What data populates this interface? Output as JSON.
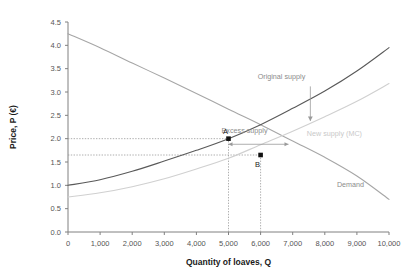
{
  "chart_data": {
    "type": "line",
    "title": "",
    "xlabel": "Quantity of loaves, Q",
    "ylabel": "Price, P (€)",
    "xlim": [
      0,
      10000
    ],
    "ylim": [
      0.0,
      4.5
    ],
    "grid": false,
    "legend": "inline-annotations",
    "xticks": [
      "0",
      "1,000",
      "2,000",
      "3,000",
      "4,000",
      "5,000",
      "6,000",
      "7,000",
      "8,000",
      "9,000",
      "10,000"
    ],
    "xtick_values": [
      0,
      1000,
      2000,
      3000,
      4000,
      5000,
      6000,
      7000,
      8000,
      9000,
      10000
    ],
    "yticks": [
      "0.0",
      "0.5",
      "1.0",
      "1.5",
      "2.0",
      "2.5",
      "3.0",
      "3.5",
      "4.0",
      "4.5"
    ],
    "ytick_values": [
      0.0,
      0.5,
      1.0,
      1.5,
      2.0,
      2.5,
      3.0,
      3.5,
      4.0,
      4.5
    ],
    "series": [
      {
        "name": "Demand",
        "color": "#a6a6a6",
        "label": "Demand",
        "label_point": {
          "x": 8800,
          "y": 0.97
        },
        "x": [
          0,
          1000,
          2000,
          3000,
          4000,
          5000,
          6000,
          7000,
          8000,
          9000,
          10000
        ],
        "values": [
          4.25,
          3.95,
          3.62,
          3.3,
          2.97,
          2.63,
          2.3,
          1.95,
          1.6,
          1.2,
          0.7
        ]
      },
      {
        "name": "Original supply",
        "color": "#595959",
        "label": "Original supply",
        "label_point": {
          "x": 6650,
          "y": 3.28
        },
        "x": [
          0,
          1000,
          2000,
          3000,
          4000,
          5000,
          6000,
          7000,
          8000,
          9000,
          10000
        ],
        "values": [
          1.0,
          1.12,
          1.3,
          1.52,
          1.75,
          2.0,
          2.3,
          2.65,
          3.02,
          3.45,
          3.95
        ]
      },
      {
        "name": "New supply (MC)",
        "color": "#d0d0d0",
        "label": "New supply (MC)",
        "label_point": {
          "x": 8300,
          "y": 2.05
        },
        "x": [
          0,
          1000,
          2000,
          3000,
          4000,
          5000,
          6000,
          7000,
          8000,
          9000,
          10000
        ],
        "values": [
          0.75,
          0.84,
          0.97,
          1.14,
          1.35,
          1.58,
          1.87,
          2.16,
          2.47,
          2.8,
          3.18
        ]
      }
    ],
    "points": [
      {
        "label": "A",
        "x": 5000,
        "y": 2.0,
        "label_dx": -3,
        "label_dy": -5
      },
      {
        "label": "B",
        "x": 6000,
        "y": 1.65,
        "label_dx": -3,
        "label_dy": 12
      }
    ],
    "annotations": [
      {
        "name": "excess-supply",
        "text": "Excess supply",
        "type": "double-arrow",
        "x_from": 5000,
        "x_to": 6870,
        "y": 1.88,
        "text_x": 5500,
        "text_y": 2.12
      },
      {
        "name": "supply-shift",
        "text": "",
        "type": "down-arrow",
        "x": 7550,
        "y_from": 3.12,
        "y_to": 2.38
      }
    ],
    "guide_lines": [
      {
        "name": "price-a-guide",
        "orientation": "horizontal",
        "y": 2.0,
        "x_from": 0,
        "x_to": 5000
      },
      {
        "name": "price-b-guide",
        "orientation": "horizontal",
        "y": 1.65,
        "x_from": 0,
        "x_to": 6000
      },
      {
        "name": "quantity-a-guide",
        "orientation": "vertical",
        "x": 5000,
        "y_from": 0,
        "y_to": 2.0
      },
      {
        "name": "quantity-b-guide",
        "orientation": "vertical",
        "x": 6000,
        "y_from": 0,
        "y_to": 1.65
      }
    ],
    "colors": {
      "axis": "#808080",
      "text": "#555555",
      "demand": "#a6a6a6",
      "original_supply": "#595959",
      "new_supply": "#d0d0d0",
      "guide": "#9a9a9a",
      "point": "#111111"
    }
  }
}
